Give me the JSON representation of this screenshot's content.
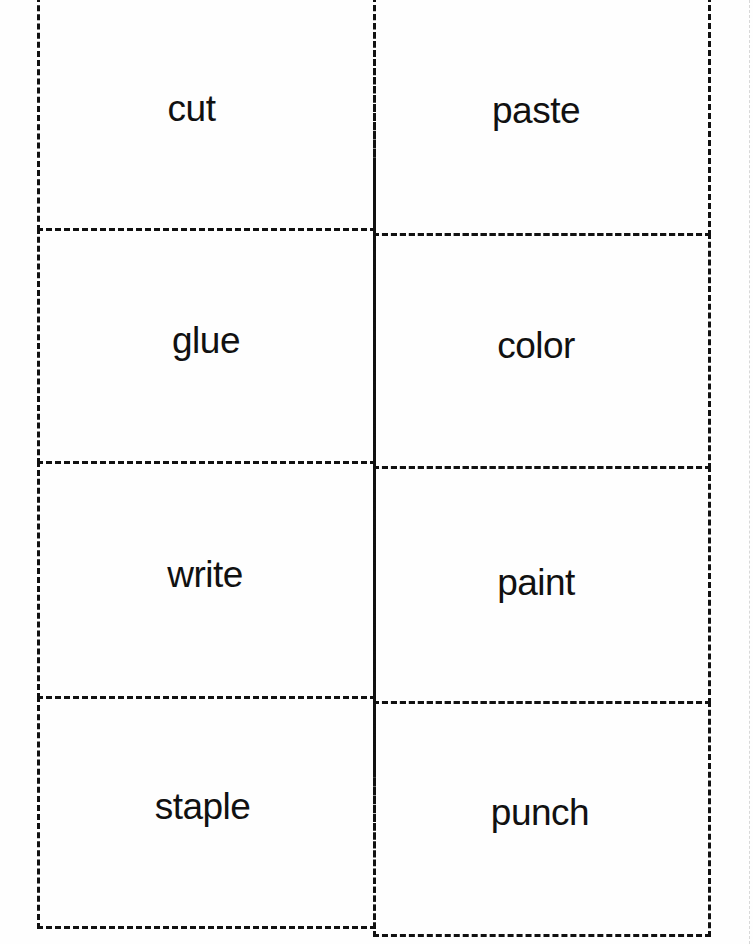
{
  "worksheet": {
    "cards": [
      {
        "label": "cut"
      },
      {
        "label": "paste"
      },
      {
        "label": "glue"
      },
      {
        "label": "color"
      },
      {
        "label": "write"
      },
      {
        "label": "paint"
      },
      {
        "label": "staple"
      },
      {
        "label": "punch"
      }
    ]
  }
}
